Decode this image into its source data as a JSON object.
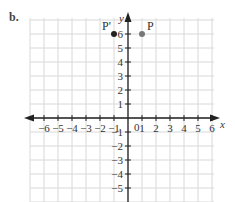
{
  "part_label": "b.",
  "axes": {
    "x_label": "x",
    "y_label": "y",
    "origin_label": "0",
    "x_ticks": [
      "−6",
      "−5",
      "−4",
      "−3",
      "−2",
      "−1",
      "1",
      "2",
      "3",
      "4",
      "5",
      "6"
    ],
    "y_ticks_pos": [
      "6",
      "5",
      "4",
      "3",
      "2",
      "1"
    ],
    "y_ticks_neg": [
      "−1",
      "−2",
      "−3",
      "−4",
      "−5"
    ]
  },
  "points": [
    {
      "label": "P'",
      "x": -1,
      "y": 6,
      "color": "#222222"
    },
    {
      "label": "P",
      "x": 1,
      "y": 6,
      "color": "#777777"
    }
  ],
  "colors": {
    "grid": "#d8d8d8",
    "axis": "#222222"
  }
}
